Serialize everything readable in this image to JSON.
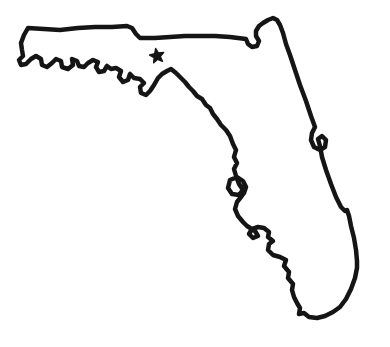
{
  "map": {
    "region": "Florida",
    "description": "Hand-drawn black outline map of the state of Florida with a solid five-pointed star marker in the panhandle area",
    "background_color": "#ffffff",
    "outline_color": "#151515",
    "outline_width": "4.5",
    "outline_path": "M 28 28 L 44 29 L 60 30 L 78 28 L 95 27 L 112 27 L 127 26 L 132 28 L 136 34 L 140 38 L 155 38 L 170 37 L 185 36 L 200 36 L 215 36 L 230 37 L 246 39 L 248 44 L 252 47 L 257 46 L 259 41 L 256 36 L 256 31 L 259 26 L 263 23 L 268 20 L 273 18 L 277 20 L 280 25 L 283 33 L 286 44 L 290 55 L 295 70 L 300 85 L 306 101 L 311 116 L 315 127 L 312 133 L 311 140 L 314 147 L 320 150 L 325 147 L 326 140 L 322 136 L 318 139 L 320 146 L 322 157 L 326 170 L 331 184 L 336 197 L 341 207 L 345 211 L 347 210 L 349 216 L 351 226 L 354 238 L 356 250 L 357 261 L 357 268 L 355 278 L 351 289 L 346 299 L 340 307 L 333 312 L 325 316 L 317 318 L 309 317 L 304 313 L 299 314 L 300 308 L 297 303 L 294 297 L 292 290 L 293 284 L 288 278 L 289 272 L 284 266 L 286 260 L 280 257 L 273 255 L 268 250 L 269 244 L 273 241 L 268 237 L 269 232 L 264 228 L 258 227 L 252 229 L 249 234 L 253 238 L 258 236 L 255 231 L 247 226 L 243 222 L 238 216 L 235 209 L 237 202 L 241 197 L 244 193 L 246 187 L 243 181 L 237 177 L 230 180 L 228 188 L 232 194 L 239 195 L 243 190 L 239 184 L 236 176 L 234 169 L 237 163 L 234 157 L 236 150 L 233 144 L 230 136 L 226 130 L 221 125 L 217 119 L 213 114 L 210 108 L 206 105 L 202 99 L 197 96 L 193 91 L 189 87 L 185 82 L 181 78 L 176 73 L 171 69 L 167 71 L 162 74 L 158 78 L 154 85 L 150 91 L 146 95 L 141 93 L 140 87 L 144 83 L 140 79 L 134 78 L 130 74 L 128 80 L 123 82 L 119 77 L 121 71 L 116 68 L 111 69 L 107 66 L 104 71 L 99 72 L 96 67 L 98 62 L 93 60 L 88 63 L 84 67 L 79 66 L 77 61 L 72 59 L 73 65 L 68 69 L 62 67 L 61 61 L 56 59 L 52 63 L 47 67 L 42 65 L 41 59 L 36 56 L 31 59 L 26 64 L 21 65 L 19 60 L 23 56 L 22 50 L 21 43 L 24 35 Z",
    "marker": {
      "type": "star",
      "color": "#151515",
      "path": "M 155.7 48.6 L 158.4 53.1 L 163.6 52.5 L 160.2 56.4 L 162.4 61.2 L 157.6 59.2 L 153.7 62.7 L 154.2 57.5 L 149.6 55 L 154.7 53.8 Z"
    }
  }
}
